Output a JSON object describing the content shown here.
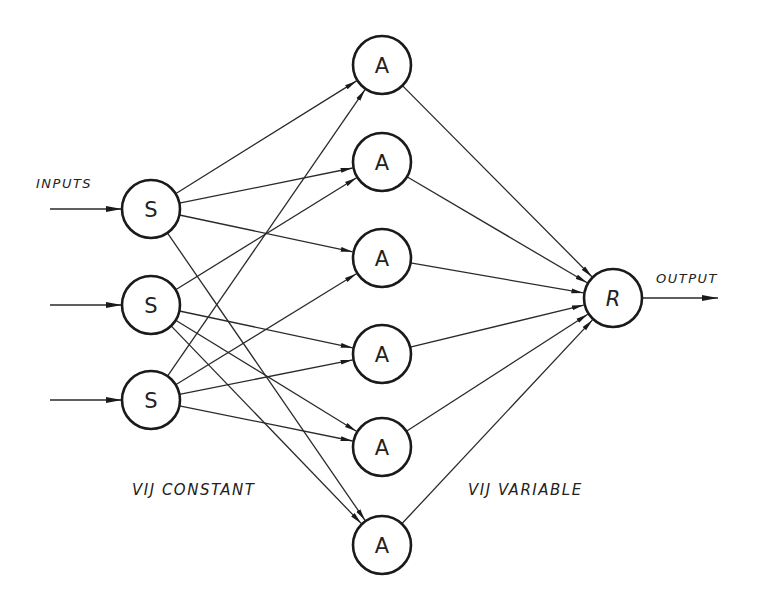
{
  "diagram": {
    "type": "perceptron-network",
    "colors": {
      "stroke": "#1a1a1a",
      "background": "#ffffff"
    },
    "labels": {
      "inputs": "INPUTS",
      "output": "OUTPUT",
      "constant": "VIJ CONSTANT",
      "variable": "VIJ VARIABLE"
    },
    "nodes": {
      "sensory": [
        {
          "id": "S1",
          "label": "S",
          "x": 151,
          "y": 209
        },
        {
          "id": "S2",
          "label": "S",
          "x": 151,
          "y": 305
        },
        {
          "id": "S3",
          "label": "S",
          "x": 151,
          "y": 400
        }
      ],
      "association": [
        {
          "id": "A1",
          "label": "A",
          "x": 382,
          "y": 65
        },
        {
          "id": "A2",
          "label": "A",
          "x": 382,
          "y": 162
        },
        {
          "id": "A3",
          "label": "A",
          "x": 382,
          "y": 258
        },
        {
          "id": "A4",
          "label": "A",
          "x": 382,
          "y": 354
        },
        {
          "id": "A5",
          "label": "A",
          "x": 382,
          "y": 447
        },
        {
          "id": "A6",
          "label": "A",
          "x": 382,
          "y": 545
        }
      ],
      "response": [
        {
          "id": "R",
          "label": "R",
          "x": 613,
          "y": 298
        }
      ]
    },
    "edges": [
      [
        "S1",
        "A1"
      ],
      [
        "S1",
        "A2"
      ],
      [
        "S1",
        "A3"
      ],
      [
        "S1",
        "A6"
      ],
      [
        "S2",
        "A2"
      ],
      [
        "S2",
        "A4"
      ],
      [
        "S2",
        "A5"
      ],
      [
        "S2",
        "A6"
      ],
      [
        "S3",
        "A1"
      ],
      [
        "S3",
        "A3"
      ],
      [
        "S3",
        "A4"
      ],
      [
        "S3",
        "A5"
      ],
      [
        "A1",
        "R"
      ],
      [
        "A2",
        "R"
      ],
      [
        "A3",
        "R"
      ],
      [
        "A4",
        "R"
      ],
      [
        "A5",
        "R"
      ],
      [
        "A6",
        "R"
      ]
    ]
  }
}
